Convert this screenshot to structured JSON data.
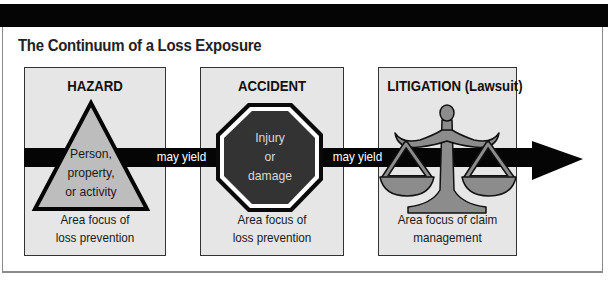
{
  "title": "The Continuum of a Loss Exposure",
  "connector_label": "may yield",
  "panels": [
    {
      "heading": "HAZARD",
      "shape": "triangle",
      "shape_text": [
        "Person,",
        "property,",
        "or activity"
      ],
      "footer": [
        "Area focus of",
        "loss prevention"
      ]
    },
    {
      "heading": "ACCIDENT",
      "shape": "octagon",
      "shape_text": [
        "Injury",
        "or",
        "damage"
      ],
      "footer": [
        "Area focus of",
        "loss prevention"
      ]
    },
    {
      "heading": "LITIGATION (Lawsuit)",
      "shape": "scales-of-justice",
      "shape_text": [],
      "footer": [
        "Area focus of claim",
        "management"
      ]
    }
  ],
  "connectors": [
    {
      "label": "may yield"
    },
    {
      "label": "may yield"
    }
  ],
  "colors": {
    "bar": "#050505",
    "panel_bg": "#e6e6e6",
    "triangle_fill": "#bdbdbd",
    "octagon_fill": "#333333",
    "scales_fill": "#8c8c8c",
    "frame_border": "#8a8a8a"
  }
}
